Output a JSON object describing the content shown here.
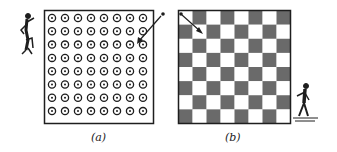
{
  "panels": [
    {
      "id": "a",
      "caption": "(a)",
      "type": "dot-grid",
      "rows": 8,
      "cols": 8
    },
    {
      "id": "b",
      "caption": "(b)",
      "type": "checkerboard",
      "rows": 8,
      "cols": 8,
      "top_left": "white"
    }
  ],
  "colors": {
    "ink": "#1e1e1e",
    "dark_cell": "#6a6a6a",
    "light_cell": "#ffffff"
  }
}
